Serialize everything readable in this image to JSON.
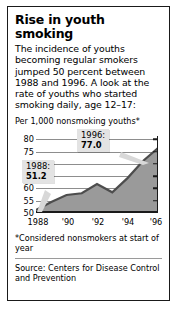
{
  "headline": "Rise in youth smoking",
  "deck": "The incidence of youths becoming regular smokers jumped 50 percent between 1988 and 1996. A look at the rate of youths who started smoking daily, age 12–17:",
  "units_label": "Per 1,000 nonsmoking youths*",
  "footnote": "*Considered nonsmokers at start of year",
  "source": "Source: Centers for Disease Control and Prevention",
  "callouts": {
    "first": {
      "year": "1988:",
      "value": "51.2"
    },
    "last": {
      "year": "1996:",
      "value": "77.0"
    }
  },
  "chart_data": {
    "type": "area",
    "title": "Rise in youth smoking",
    "xlabel": "",
    "ylabel": "Per 1,000 nonsmoking youths*",
    "ylim": [
      50,
      82
    ],
    "xlim": [
      1988,
      1996
    ],
    "yticks": [
      50,
      55,
      60,
      65,
      70,
      75,
      80
    ],
    "ytick_labels": [
      "50",
      "55",
      "60",
      "65",
      "70",
      "75",
      "80"
    ],
    "xticks": [
      1988,
      1990,
      1992,
      1994,
      1996
    ],
    "xtick_labels": [
      "1988",
      "'90",
      "'92",
      "'94",
      "'96"
    ],
    "grid": true,
    "legend": null,
    "series": [
      {
        "name": "Youths who started smoking daily per 1,000 nonsmoking youths",
        "x": [
          1988,
          1989,
          1990,
          1991,
          1992,
          1993,
          1994,
          1995,
          1996
        ],
        "values": [
          51.2,
          54.6,
          57.5,
          58.2,
          62.0,
          58.6,
          64.5,
          71.5,
          77.0
        ]
      }
    ],
    "annotations": [
      {
        "x": 1988,
        "y": 51.2,
        "text": "1988: 51.2"
      },
      {
        "x": 1996,
        "y": 77.0,
        "text": "1996: 77.0"
      }
    ],
    "colors": {
      "area_fill": "#9a9a9a",
      "area_line": "#4d4d4d",
      "grid": "#8d8d8d",
      "axis": "#1a1a1a"
    }
  }
}
